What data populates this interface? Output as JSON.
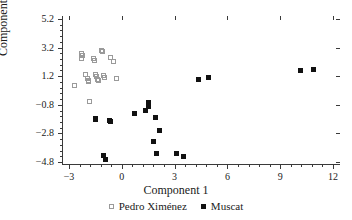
{
  "chart_data": {
    "type": "scatter",
    "title": "",
    "xlabel": "Component 1",
    "ylabel": "Component 2",
    "xlim": [
      -3.4,
      12.4
    ],
    "ylim": [
      -5.0,
      5.4
    ],
    "xticks": [
      -3,
      0,
      3,
      6,
      9,
      12
    ],
    "xtick_labels": [
      "−3",
      "0",
      "3",
      "6",
      "9",
      "12"
    ],
    "yticks": [
      5.2,
      3.2,
      1.2,
      -0.8,
      -2.8,
      -4.8
    ],
    "ytick_labels": [
      "5.2",
      "3.2",
      "1.2",
      "−0.8",
      "−2.8",
      "−4.8"
    ],
    "grid": false,
    "minor_ticks": true,
    "legend_position": "below",
    "series": [
      {
        "name": "Pedro Ximénez",
        "marker": "open-square",
        "color": "#9a9a9a",
        "points": [
          [
            -2.7,
            0.52
          ],
          [
            -2.3,
            2.78
          ],
          [
            -2.28,
            2.4
          ],
          [
            -2.22,
            2.62
          ],
          [
            -2.05,
            1.3
          ],
          [
            -1.95,
            1.05
          ],
          [
            -1.92,
            0.88
          ],
          [
            -1.88,
            0.8
          ],
          [
            -1.82,
            -0.58
          ],
          [
            -1.62,
            2.42
          ],
          [
            -1.58,
            2.3
          ],
          [
            -1.48,
            1.32
          ],
          [
            -1.45,
            1.18
          ],
          [
            -1.4,
            0.98
          ],
          [
            -1.35,
            0.92
          ],
          [
            -1.18,
            3.02
          ],
          [
            -1.12,
            2.92
          ],
          [
            -1.05,
            1.22
          ],
          [
            -0.98,
            1.12
          ],
          [
            -0.62,
            2.48
          ],
          [
            -0.45,
            2.22
          ],
          [
            -0.32,
            1.05
          ]
        ]
      },
      {
        "name": "Muscat",
        "marker": "filled-square",
        "color": "#111111",
        "points": [
          [
            -1.52,
            -1.78
          ],
          [
            -1.48,
            -1.85
          ],
          [
            -1.02,
            -4.32
          ],
          [
            -0.95,
            -4.62
          ],
          [
            -0.72,
            -1.9
          ],
          [
            -0.62,
            -1.95
          ],
          [
            0.72,
            -1.42
          ],
          [
            1.35,
            -1.22
          ],
          [
            1.5,
            -0.92
          ],
          [
            1.52,
            -0.62
          ],
          [
            1.78,
            -3.38
          ],
          [
            1.92,
            -1.68
          ],
          [
            1.95,
            -4.18
          ],
          [
            2.12,
            -2.62
          ],
          [
            3.08,
            -4.22
          ],
          [
            3.48,
            -4.38
          ],
          [
            4.38,
            0.95
          ],
          [
            4.92,
            1.08
          ],
          [
            10.18,
            1.62
          ],
          [
            10.88,
            1.65
          ]
        ]
      }
    ]
  },
  "legend": {
    "items": [
      {
        "label": "Pedro Ximénez",
        "marker": "open-square"
      },
      {
        "label": "Muscat",
        "marker": "filled-square"
      }
    ]
  }
}
